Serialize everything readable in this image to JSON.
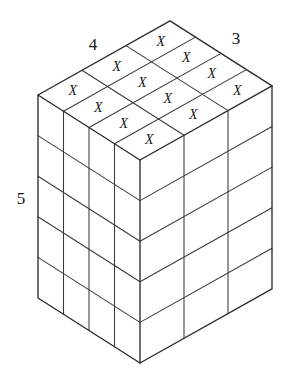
{
  "figure": {
    "type": "isometric-block-diagram",
    "background_color": "#ffffff",
    "line_color": "#2b2b2b",
    "text_color": "#111111"
  },
  "dimensions": {
    "width_label": "4",
    "depth_label": "3",
    "height_label": "5",
    "width_value": 4,
    "depth_value": 3,
    "height_value": 5,
    "total_cubes": 60
  },
  "labels": [
    {
      "name": "width-label",
      "text": "4",
      "x": 93,
      "y": 44
    },
    {
      "name": "depth-label",
      "text": "3",
      "x": 236,
      "y": 38
    },
    {
      "name": "height-label",
      "text": "5",
      "x": 21,
      "y": 198
    }
  ],
  "top_face": {
    "rows": 3,
    "cols": 4,
    "marked_symbol": "X",
    "marked_count": 12,
    "marks": [
      {
        "row": 0,
        "col": 0,
        "symbol": "X"
      },
      {
        "row": 0,
        "col": 1,
        "symbol": "X"
      },
      {
        "row": 0,
        "col": 2,
        "symbol": "X"
      },
      {
        "row": 0,
        "col": 3,
        "symbol": "X"
      },
      {
        "row": 1,
        "col": 0,
        "symbol": "X"
      },
      {
        "row": 1,
        "col": 1,
        "symbol": "X"
      },
      {
        "row": 1,
        "col": 2,
        "symbol": "X"
      },
      {
        "row": 1,
        "col": 3,
        "symbol": "X"
      },
      {
        "row": 2,
        "col": 0,
        "symbol": "X"
      },
      {
        "row": 2,
        "col": 1,
        "symbol": "X"
      },
      {
        "row": 2,
        "col": 2,
        "symbol": "X"
      },
      {
        "row": 2,
        "col": 3,
        "symbol": "X"
      }
    ]
  },
  "left_face": {
    "cols": 4,
    "rows": 5,
    "cells": 20
  },
  "right_face": {
    "cols": 3,
    "rows": 5,
    "cells": 15
  },
  "geometry": {
    "origin_front_top": {
      "x": 140,
      "y": 160
    },
    "vec_left": {
      "x": -25.5,
      "y": -16.25
    },
    "vec_right": {
      "x": 44.0,
      "y": -24.7
    },
    "vec_down": {
      "x": 0,
      "y": 40.6
    },
    "vertices": {
      "top_back": {
        "x": 168,
        "y": 22
      },
      "left_corner": {
        "x": 38,
        "y": 95
      },
      "right_corner": {
        "x": 272,
        "y": 86
      },
      "front_top": {
        "x": 140,
        "y": 160
      },
      "front_bottom": {
        "x": 140,
        "y": 363
      },
      "left_bottom": {
        "x": 38,
        "y": 298
      },
      "right_bottom": {
        "x": 272,
        "y": 289
      }
    }
  }
}
